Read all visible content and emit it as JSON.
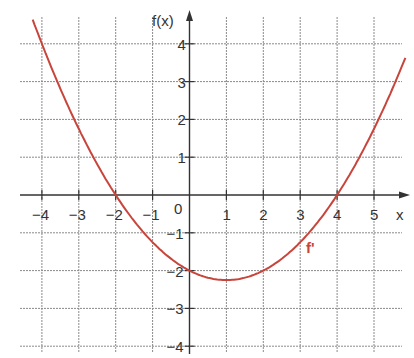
{
  "chart_data": {
    "type": "line",
    "title": "",
    "xlabel": "x",
    "ylabel": "f(x)",
    "xlim": [
      -4.6,
      6
    ],
    "ylim": [
      -4.2,
      4.8
    ],
    "grid": true,
    "legend": null,
    "x_ticks": [
      -4,
      -3,
      -2,
      -1,
      0,
      1,
      2,
      3,
      4,
      5
    ],
    "y_ticks": [
      -4,
      -3,
      -2,
      -1,
      1,
      2,
      3,
      4
    ],
    "x_tick_labels": [
      "−4",
      "−3",
      "−2",
      "−1",
      "0",
      "1",
      "2",
      "3",
      "4",
      "5"
    ],
    "y_tick_labels": [
      "−4",
      "−3",
      "−2",
      "−1",
      "1",
      "2",
      "3",
      "4"
    ],
    "series": [
      {
        "name": "f'",
        "color": "#c8453c",
        "formula": "0.25*(x+2)*(x-4)",
        "x": [
          -4.25,
          -4,
          -3,
          -2,
          -1,
          0,
          1,
          2,
          3,
          4,
          5,
          5.85
        ],
        "y": [
          4.64,
          4,
          1.75,
          0,
          -1.25,
          -2,
          -2.25,
          -2,
          -1.25,
          0,
          1.75,
          3.63
        ]
      }
    ],
    "annotations": [
      {
        "text": "f'",
        "x": 3.3,
        "y": -1.5,
        "color": "#c8453c"
      }
    ]
  },
  "labels": {
    "y_axis": "f(x)",
    "x_axis": "x",
    "curve": "f'",
    "origin": "0"
  }
}
